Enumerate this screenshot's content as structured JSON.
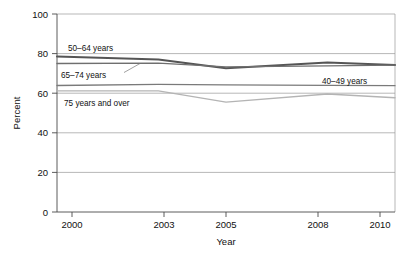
{
  "chart_data": {
    "type": "line",
    "title": "",
    "xlabel": "Year",
    "ylabel": "Percent",
    "xlim": [
      2000,
      2010
    ],
    "ylim": [
      0,
      100
    ],
    "x": [
      2000,
      2003,
      2005,
      2008,
      2010
    ],
    "xticks": [
      "2000",
      "2003",
      "2005",
      "2008",
      "2010"
    ],
    "yticks": [
      "0",
      "20",
      "40",
      "60",
      "80",
      "100"
    ],
    "grid": "horizontal",
    "legend": "inline-labels",
    "series": [
      {
        "name": "50–64 years",
        "label": "50–64 years",
        "color": "#555555",
        "width": 2.0,
        "values": [
          78.5,
          77.0,
          72.6,
          75.5,
          74.3
        ]
      },
      {
        "name": "65–74 years",
        "label": "65–74 years",
        "color": "#6f6f6f",
        "width": 1.4,
        "values": [
          75.0,
          75.2,
          73.3,
          73.8,
          74.2
        ]
      },
      {
        "name": "40–49 years",
        "label": "40–49 years",
        "color": "#7a7a7a",
        "width": 1.3,
        "values": [
          63.9,
          64.5,
          64.2,
          64.0,
          63.8
        ]
      },
      {
        "name": "75 years and over",
        "label": "75 years and over",
        "color": "#b4b4b4",
        "width": 1.3,
        "values": [
          61.2,
          61.2,
          55.5,
          59.6,
          57.7
        ]
      }
    ]
  },
  "axes": {
    "y_title": "Percent",
    "x_title": "Year",
    "y_tick_0": "0",
    "y_tick_20": "20",
    "y_tick_40": "40",
    "y_tick_60": "60",
    "y_tick_80": "80",
    "y_tick_100": "100",
    "x_tick_2000": "2000",
    "x_tick_2003": "2003",
    "x_tick_2005": "2005",
    "x_tick_2008": "2008",
    "x_tick_2010": "2010"
  },
  "labels": {
    "series_50_64": "50–64 years",
    "series_65_74": "65–74 years",
    "series_40_49": "40–49 years",
    "series_75_plus": "75 years and over"
  }
}
